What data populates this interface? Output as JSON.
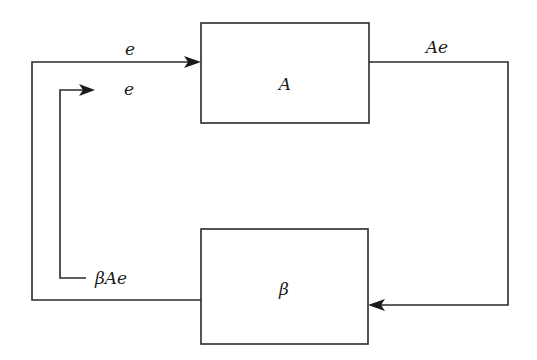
{
  "diagram": {
    "type": "feedback-loop block diagram",
    "blocks": {
      "amplifier": {
        "label": "A"
      },
      "feedback": {
        "label": "β"
      }
    },
    "signals": {
      "input_top": "e",
      "input_inner": "e",
      "output": "Ae",
      "feedback_signal": "βAe"
    },
    "colors": {
      "line": "#2a2a2a",
      "text": "#1a1a1a",
      "background": "#ffffff"
    }
  }
}
